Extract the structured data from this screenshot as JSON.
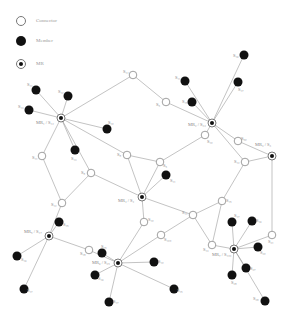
{
  "legend": {
    "connector": "Connector",
    "member": "Member",
    "mr": "MR"
  },
  "colors": {
    "edge": "#9a9a9a",
    "member_fill": "#111111",
    "connector_stroke": "#777777",
    "label": "#888888"
  },
  "nodes": [
    {
      "id": "MR1",
      "type": "mr",
      "x": 61,
      "y": 118,
      "label": "MR₁ / S₁₂",
      "lx": 36,
      "ly": 124
    },
    {
      "id": "MR2",
      "type": "mr",
      "x": 212,
      "y": 123,
      "label": "MR₂ / S₂₃",
      "lx": 188,
      "ly": 126
    },
    {
      "id": "MR3",
      "type": "mr",
      "x": 272,
      "y": 156,
      "label": "MR₃ / S₃",
      "lx": 255,
      "ly": 146
    },
    {
      "id": "MR4",
      "type": "mr",
      "x": 142,
      "y": 197,
      "label": "MR₄ / S₄",
      "lx": 118,
      "ly": 202
    },
    {
      "id": "MR5",
      "type": "mr",
      "x": 49,
      "y": 236,
      "label": "MR₅ / S₁₇",
      "lx": 24,
      "ly": 233
    },
    {
      "id": "MR6",
      "type": "mr",
      "x": 118,
      "y": 263,
      "label": "MR₆ / S₂₅",
      "lx": 92,
      "ly": 264
    },
    {
      "id": "MR7",
      "type": "mr",
      "x": 234,
      "y": 249,
      "label": "MR₇ / S₁₀₃",
      "lx": 212,
      "ly": 256
    },
    {
      "id": "c1",
      "type": "connector",
      "x": 133,
      "y": 75,
      "label": "S₁₄",
      "lx": 123,
      "ly": 73
    },
    {
      "id": "c2",
      "type": "connector",
      "x": 166,
      "y": 102,
      "label": "S₅",
      "lx": 156,
      "ly": 106
    },
    {
      "id": "c3",
      "type": "connector",
      "x": 42,
      "y": 156,
      "label": "S₁₁",
      "lx": 32,
      "ly": 159
    },
    {
      "id": "c4",
      "type": "connector",
      "x": 127,
      "y": 155,
      "label": "S₈",
      "lx": 117,
      "ly": 156
    },
    {
      "id": "c5",
      "type": "connector",
      "x": 160,
      "y": 162,
      "label": "S₅",
      "lx": 163,
      "ly": 167
    },
    {
      "id": "c6",
      "type": "connector",
      "x": 205,
      "y": 135,
      "label": "S₁₀",
      "lx": 207,
      "ly": 143
    },
    {
      "id": "c7",
      "type": "connector",
      "x": 238,
      "y": 141,
      "label": "S₅₀",
      "lx": 241,
      "ly": 140
    },
    {
      "id": "c8",
      "type": "connector",
      "x": 245,
      "y": 162,
      "label": "S₁₂",
      "lx": 234,
      "ly": 163
    },
    {
      "id": "c9",
      "type": "connector",
      "x": 91,
      "y": 173,
      "label": "S₈",
      "lx": 81,
      "ly": 174
    },
    {
      "id": "c10",
      "type": "connector",
      "x": 62,
      "y": 203,
      "label": "S₁₂",
      "lx": 51,
      "ly": 206
    },
    {
      "id": "c11",
      "type": "connector",
      "x": 193,
      "y": 215,
      "label": "S₁₁",
      "lx": 182,
      "ly": 214
    },
    {
      "id": "c12",
      "type": "connector",
      "x": 222,
      "y": 201,
      "label": "S₁₅",
      "lx": 226,
      "ly": 202
    },
    {
      "id": "c13",
      "type": "connector",
      "x": 144,
      "y": 222,
      "label": "S₁₀",
      "lx": 148,
      "ly": 221
    },
    {
      "id": "c14",
      "type": "connector",
      "x": 161,
      "y": 235,
      "label": "S₁₀₀",
      "lx": 164,
      "ly": 241
    },
    {
      "id": "c15",
      "type": "connector",
      "x": 89,
      "y": 250,
      "label": "S₁₈",
      "lx": 80,
      "ly": 255
    },
    {
      "id": "c16",
      "type": "connector",
      "x": 212,
      "y": 245,
      "label": "S₁₃",
      "lx": 203,
      "ly": 251
    },
    {
      "id": "c17",
      "type": "connector",
      "x": 272,
      "y": 235,
      "label": "S₂₁",
      "lx": 268,
      "ly": 243
    },
    {
      "id": "m1",
      "type": "member",
      "x": 36,
      "y": 90,
      "label": "S₁₁",
      "lx": 27,
      "ly": 86
    },
    {
      "id": "m2",
      "type": "member",
      "x": 68,
      "y": 96,
      "label": "S₁₂",
      "lx": 58,
      "ly": 93
    },
    {
      "id": "m3",
      "type": "member",
      "x": 29,
      "y": 110,
      "label": "S₁₃",
      "lx": 18,
      "ly": 108
    },
    {
      "id": "m4",
      "type": "member",
      "x": 107,
      "y": 129,
      "label": "S₁₀",
      "lx": 108,
      "ly": 124
    },
    {
      "id": "m5",
      "type": "member",
      "x": 75,
      "y": 150,
      "label": "S₁₃",
      "lx": 71,
      "ly": 160
    },
    {
      "id": "m6",
      "type": "member",
      "x": 185,
      "y": 81,
      "label": "S₁₁",
      "lx": 175,
      "ly": 79
    },
    {
      "id": "m7",
      "type": "member",
      "x": 192,
      "y": 102,
      "label": "S₁₅",
      "lx": 182,
      "ly": 103
    },
    {
      "id": "m8",
      "type": "member",
      "x": 244,
      "y": 55,
      "label": "S₁₆",
      "lx": 233,
      "ly": 57
    },
    {
      "id": "m9",
      "type": "member",
      "x": 238,
      "y": 82,
      "label": "S₁₇",
      "lx": 238,
      "ly": 91
    },
    {
      "id": "m10",
      "type": "member",
      "x": 166,
      "y": 175,
      "label": "S₁₁",
      "lx": 170,
      "ly": 182
    },
    {
      "id": "m11",
      "type": "member",
      "x": 59,
      "y": 222,
      "label": "S₁₅",
      "lx": 63,
      "ly": 226
    },
    {
      "id": "m12",
      "type": "member",
      "x": 17,
      "y": 256,
      "label": "S₁₆",
      "lx": 21,
      "ly": 261
    },
    {
      "id": "m13",
      "type": "member",
      "x": 24,
      "y": 289,
      "label": "S₁₇",
      "lx": 27,
      "ly": 292
    },
    {
      "id": "m14",
      "type": "member",
      "x": 102,
      "y": 253,
      "label": "S₁₅",
      "lx": 101,
      "ly": 248
    },
    {
      "id": "m15",
      "type": "member",
      "x": 95,
      "y": 275,
      "label": "S₁₆",
      "lx": 98,
      "ly": 280
    },
    {
      "id": "m16",
      "type": "member",
      "x": 154,
      "y": 262,
      "label": "S₁₀",
      "lx": 158,
      "ly": 263
    },
    {
      "id": "m17",
      "type": "member",
      "x": 174,
      "y": 289,
      "label": "S₁₅",
      "lx": 177,
      "ly": 292
    },
    {
      "id": "m18",
      "type": "member",
      "x": 109,
      "y": 302,
      "label": "S₁₇",
      "lx": 113,
      "ly": 303
    },
    {
      "id": "m19",
      "type": "member",
      "x": 232,
      "y": 222,
      "label": "S₁₇",
      "lx": 234,
      "ly": 217
    },
    {
      "id": "m20",
      "type": "member",
      "x": 252,
      "y": 221,
      "label": "S₁₆",
      "lx": 256,
      "ly": 222
    },
    {
      "id": "m21",
      "type": "member",
      "x": 258,
      "y": 247,
      "label": "S₂₀",
      "lx": 260,
      "ly": 254
    },
    {
      "id": "m22",
      "type": "member",
      "x": 246,
      "y": 268,
      "label": "S₂₇",
      "lx": 250,
      "ly": 270
    },
    {
      "id": "m23",
      "type": "member",
      "x": 232,
      "y": 275,
      "label": "S₂₈",
      "lx": 231,
      "ly": 284
    },
    {
      "id": "m24",
      "type": "member",
      "x": 265,
      "y": 301,
      "label": "S₂₉",
      "lx": 253,
      "ly": 300
    }
  ],
  "edges": [
    [
      "MR1",
      "m1"
    ],
    [
      "MR1",
      "m2"
    ],
    [
      "MR1",
      "m3"
    ],
    [
      "MR1",
      "m4"
    ],
    [
      "MR1",
      "m5"
    ],
    [
      "MR1",
      "c1"
    ],
    [
      "MR1",
      "c3"
    ],
    [
      "MR1",
      "c9"
    ],
    [
      "MR1",
      "c4"
    ],
    [
      "c1",
      "c2"
    ],
    [
      "c2",
      "MR2"
    ],
    [
      "MR2",
      "m6"
    ],
    [
      "MR2",
      "m7"
    ],
    [
      "MR2",
      "m8"
    ],
    [
      "MR2",
      "m9"
    ],
    [
      "MR2",
      "c6"
    ],
    [
      "MR2",
      "c7"
    ],
    [
      "MR2",
      "c8"
    ],
    [
      "c7",
      "MR3"
    ],
    [
      "c8",
      "MR3"
    ],
    [
      "MR3",
      "c17"
    ],
    [
      "c6",
      "c5"
    ],
    [
      "c4",
      "c5"
    ],
    [
      "c4",
      "MR4"
    ],
    [
      "c5",
      "MR4"
    ],
    [
      "MR4",
      "m10"
    ],
    [
      "c9",
      "MR4"
    ],
    [
      "MR4",
      "c13"
    ],
    [
      "MR4",
      "c11"
    ],
    [
      "c3",
      "c10"
    ],
    [
      "c9",
      "c10"
    ],
    [
      "c10",
      "MR5"
    ],
    [
      "c8",
      "c12"
    ],
    [
      "c12",
      "c11"
    ],
    [
      "c12",
      "c16"
    ],
    [
      "c11",
      "c14"
    ],
    [
      "c11",
      "c16"
    ],
    [
      "MR5",
      "m11"
    ],
    [
      "MR5",
      "m12"
    ],
    [
      "MR5",
      "m13"
    ],
    [
      "MR5",
      "c15"
    ],
    [
      "c15",
      "MR6"
    ],
    [
      "MR6",
      "m14"
    ],
    [
      "MR6",
      "m15"
    ],
    [
      "MR6",
      "m16"
    ],
    [
      "MR6",
      "m17"
    ],
    [
      "MR6",
      "m18"
    ],
    [
      "MR6",
      "c13"
    ],
    [
      "MR6",
      "c14"
    ],
    [
      "c16",
      "MR7"
    ],
    [
      "MR7",
      "m19"
    ],
    [
      "MR7",
      "m20"
    ],
    [
      "MR7",
      "m21"
    ],
    [
      "MR7",
      "m22"
    ],
    [
      "MR7",
      "m23"
    ],
    [
      "MR7",
      "m24"
    ],
    [
      "MR7",
      "c17"
    ]
  ]
}
